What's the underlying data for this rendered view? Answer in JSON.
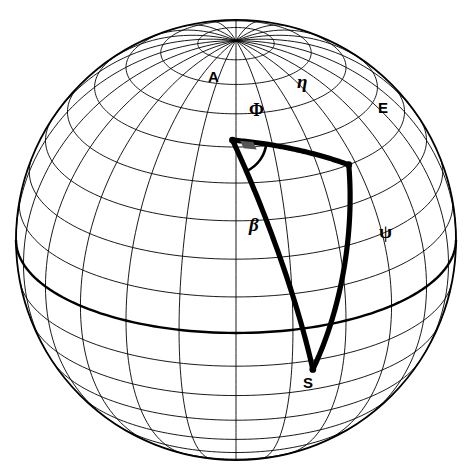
{
  "figure": {
    "kind": "spherical-trigonometry-globe-diagram",
    "background_color": "#ffffff",
    "ink_color": "#000000",
    "sphere": {
      "center_x": 236,
      "center_y": 240,
      "radius": 220,
      "outline_visible": true,
      "graticule": {
        "meridian_step_deg": 15,
        "parallel_step_deg": 10,
        "pole_visible": "north",
        "pole_screen_x": 235,
        "pole_screen_y": 41,
        "view_latitude_deg": 25,
        "view_longitude_deg": 0,
        "equator_emphasized": true
      }
    },
    "vertices": [
      {
        "id": "A",
        "label": "A",
        "x": 222,
        "y": 92,
        "label_x": 208,
        "label_y": 69,
        "label_style": "roman-bold"
      },
      {
        "id": "E",
        "label": "E",
        "x": 372,
        "y": 112,
        "label_x": 378,
        "label_y": 100,
        "label_style": "roman-bold"
      },
      {
        "id": "S",
        "label": "S",
        "x": 310,
        "y": 370,
        "label_x": 303,
        "label_y": 375,
        "label_style": "roman-bold"
      }
    ],
    "sides": [
      {
        "id": "AE",
        "label": "η",
        "label_name": "eta",
        "from": "A",
        "to": "E",
        "label_x": 297,
        "label_y": 72
      },
      {
        "id": "AS",
        "label": "β",
        "label_name": "beta",
        "from": "A",
        "to": "S",
        "label_x": 249,
        "label_y": 215
      },
      {
        "id": "ES",
        "label": "ψ",
        "label_name": "psi",
        "from": "E",
        "to": "S",
        "label_x": 379,
        "label_y": 222
      }
    ],
    "angles": [
      {
        "id": "PhiA",
        "label": "Φ",
        "label_name": "Phi",
        "at_vertex": "A",
        "label_x": 249,
        "label_y": 101,
        "arc_radius": 34,
        "right_angle_marker": true
      }
    ]
  },
  "chart_data": {
    "type": "diagram",
    "title": "",
    "labels": [
      "A",
      "E",
      "S",
      "η",
      "β",
      "ψ",
      "Φ"
    ]
  }
}
